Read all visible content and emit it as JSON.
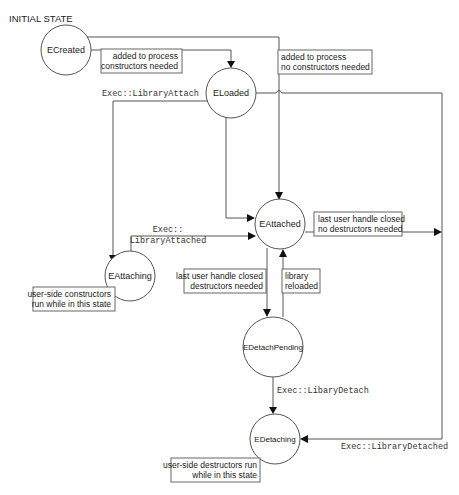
{
  "diagram": {
    "title": "INITIAL STATE",
    "states": {
      "created": "ECreated",
      "loaded": "ELoaded",
      "attached": "EAttached",
      "attaching": "EAttaching",
      "detach_pending": "EDetachPending",
      "detaching": "EDetaching"
    },
    "transitions": {
      "created_to_loaded_line1": "added to process",
      "created_to_loaded_line2": "constructors needed",
      "created_to_attached_line1": "added to process",
      "created_to_attached_line2": "no constructors needed",
      "loaded_to_attaching": "Exec::LibraryAttach",
      "attaching_to_attached_line1": "Exec::",
      "attaching_to_attached_line2": "LibraryAttached",
      "attached_to_detached_line1": "last user handle closed",
      "attached_to_detached_line2": "no destructors needed",
      "attached_to_pending_line1": "last user handle closed",
      "attached_to_pending_line2": "destructors needed",
      "pending_to_attached_line1": "library",
      "pending_to_attached_line2": "reloaded",
      "pending_to_detaching": "Exec::LibaryDetach",
      "loaded_to_detaching": "Exec::LibraryDetached"
    },
    "notes": {
      "attaching_line1": "user-side constructors",
      "attaching_line2": "run while in this state",
      "detaching_line1": "user-side destructors run",
      "detaching_line2": "while in this state"
    },
    "colors": {
      "line": "#555555",
      "arrowhead": "#111111",
      "background": "#ffffff"
    }
  }
}
